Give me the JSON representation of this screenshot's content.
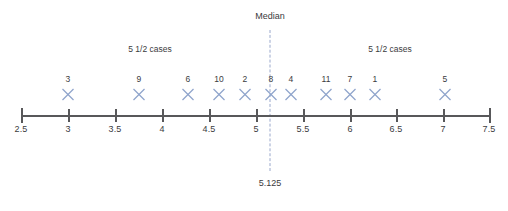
{
  "chart_data": {
    "type": "scatter",
    "title": "",
    "xlabel": "",
    "ylabel": "",
    "xlim": [
      2.5,
      7.5
    ],
    "grid": false,
    "legend": null,
    "marker_glyph": "x-marker",
    "marker_color": "#8fa4cc",
    "axis_color": "#58585a",
    "median_color": "#9aa8cc",
    "axis": {
      "ticks": [
        {
          "value": 2.5,
          "label": "2.5",
          "px": 21
        },
        {
          "value": 3,
          "label": "3",
          "px": 68
        },
        {
          "value": 3.5,
          "label": "3.5",
          "px": 115
        },
        {
          "value": 4,
          "label": "4",
          "px": 162
        },
        {
          "value": 4.5,
          "label": "4.5",
          "px": 209
        },
        {
          "value": 5,
          "label": "5",
          "px": 256
        },
        {
          "value": 5.5,
          "label": "5.5",
          "px": 303
        },
        {
          "value": 6,
          "label": "6",
          "px": 350
        },
        {
          "value": 6.5,
          "label": "6.5",
          "px": 396
        },
        {
          "value": 7,
          "label": "7",
          "px": 443
        },
        {
          "value": 7.5,
          "label": "7.5",
          "px": 489
        }
      ]
    },
    "points": [
      {
        "label": "3",
        "x": 3.0,
        "px": 68
      },
      {
        "label": "9",
        "x": 3.76,
        "px": 139
      },
      {
        "label": "6",
        "x": 4.28,
        "px": 188
      },
      {
        "label": "10",
        "x": 4.61,
        "px": 219
      },
      {
        "label": "2",
        "x": 4.89,
        "px": 245
      },
      {
        "label": "8",
        "x": 5.17,
        "px": 271
      },
      {
        "label": "4",
        "x": 5.38,
        "px": 291
      },
      {
        "label": "11",
        "x": 5.76,
        "px": 326
      },
      {
        "label": "7",
        "x": 6.01,
        "px": 350
      },
      {
        "label": "1",
        "x": 6.28,
        "px": 375
      },
      {
        "label": "5",
        "x": 7.03,
        "px": 445
      }
    ],
    "median": {
      "title": "Median",
      "value_label": "5.125",
      "value": 5.125,
      "px": 270
    },
    "annotations": [
      {
        "text": "5 1/2 cases",
        "px": 150
      },
      {
        "text": "5 1/2 cases",
        "px": 390
      }
    ]
  }
}
